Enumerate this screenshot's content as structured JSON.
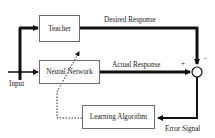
{
  "diagram": {
    "blocks": {
      "teacher": "Teacher",
      "neural_network": "Neural Network",
      "learning_algorithm": "Learning Algorithm"
    },
    "signals": {
      "input": "Input",
      "desired_response": "Desired Response",
      "actual_response": "Actual Response",
      "error_signal": "Error Signal"
    },
    "comparator": {
      "plus_sign": "+",
      "minus_sign": "−"
    },
    "colors": {
      "line": "#111111",
      "box_border": "#6e6e6e",
      "background": "#ffffff"
    }
  }
}
